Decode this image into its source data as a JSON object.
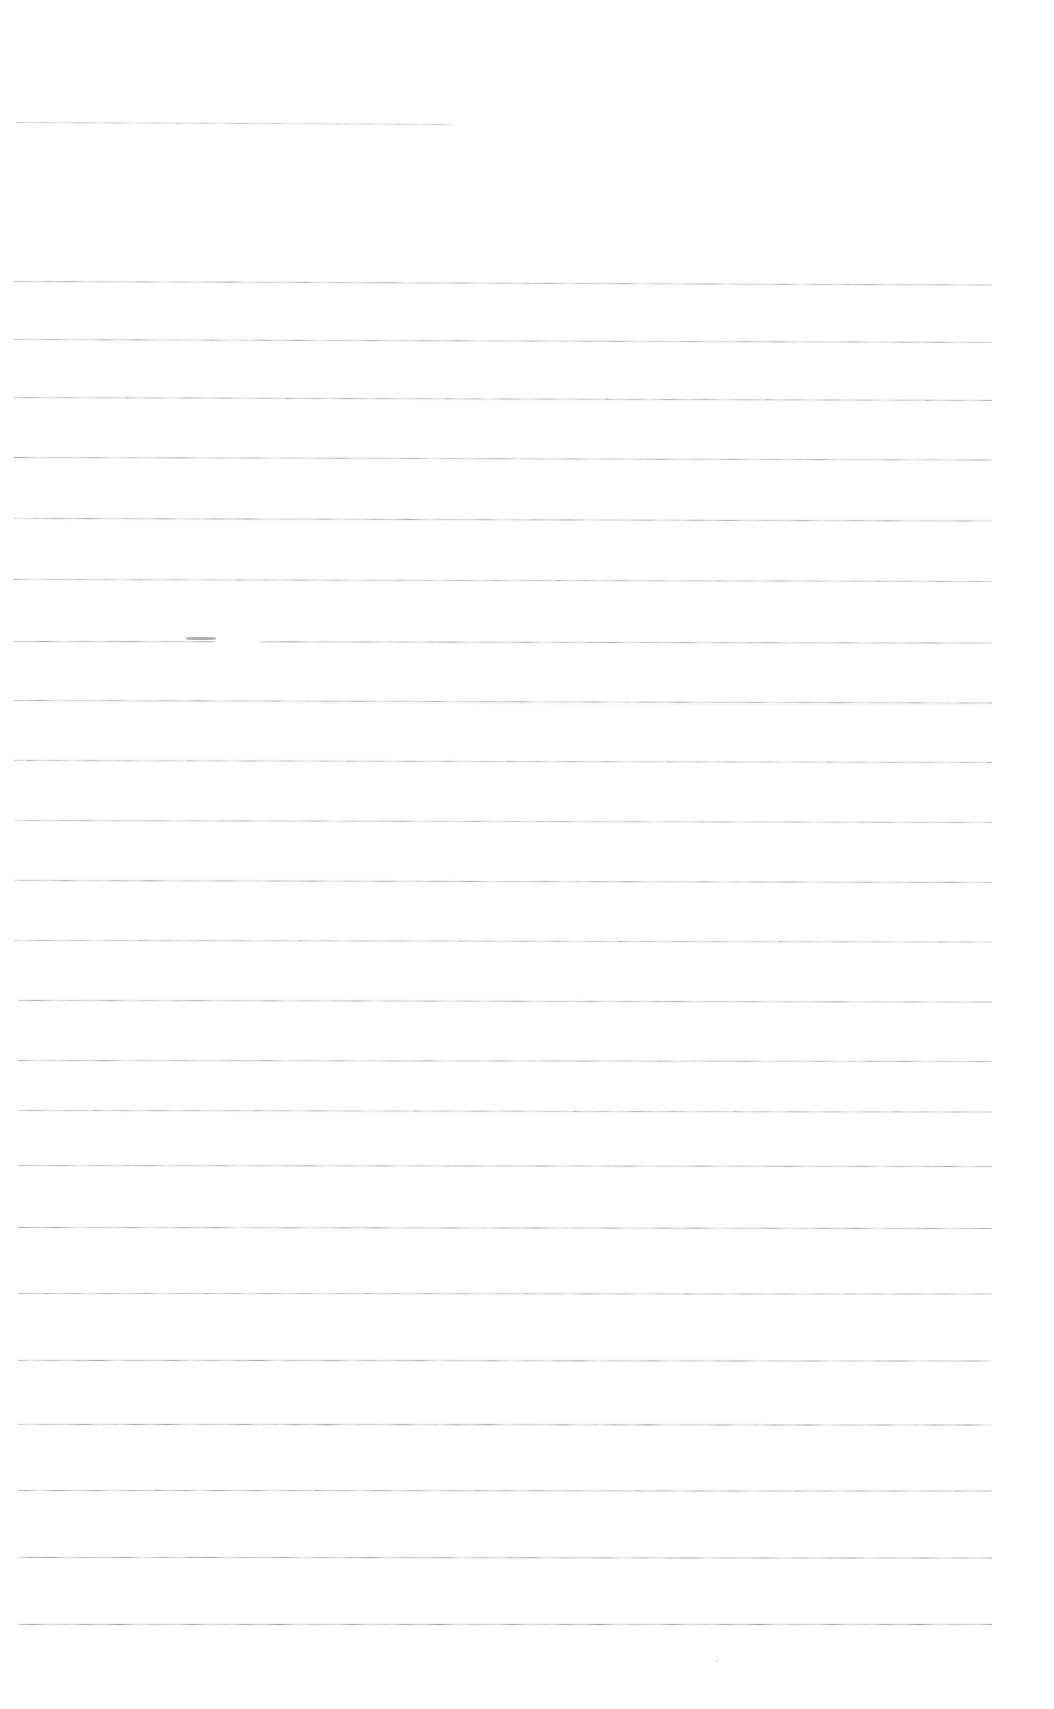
{
  "document": {
    "kind": "scanned-lined-paper",
    "title": "Blank ruled notebook page (scan)",
    "page_width": 1054,
    "page_height": 1709,
    "background_color": "#ffffff",
    "rule_color": "#8c8c90",
    "rule_color_light": "#b8b8bc",
    "text_content": "",
    "visible_text_count": 0,
    "rule_count": 24
  },
  "rules": [
    {
      "id": "rule-1",
      "y": 122,
      "x_start": 16,
      "x_end": 452,
      "slope": 2.0,
      "thickness": 1.0,
      "texture": "tex-a",
      "opacity": 0.55,
      "ghost": false
    },
    {
      "id": "rule-2",
      "y": 281,
      "x_start": 14,
      "x_end": 992,
      "slope": 3.5,
      "thickness": 1.0,
      "texture": "tex-b",
      "opacity": 0.72,
      "ghost": false
    },
    {
      "id": "rule-3",
      "y": 339,
      "x_start": 14,
      "x_end": 992,
      "slope": 3.0,
      "thickness": 1.0,
      "texture": "tex-c",
      "opacity": 0.7,
      "ghost": false
    },
    {
      "id": "rule-4",
      "y": 397,
      "x_start": 14,
      "x_end": 992,
      "slope": 3.0,
      "thickness": 1.0,
      "texture": "tex-a",
      "opacity": 0.74,
      "ghost": false
    },
    {
      "id": "rule-5",
      "y": 457,
      "x_start": 14,
      "x_end": 992,
      "slope": 2.5,
      "thickness": 1.0,
      "texture": "tex-b",
      "opacity": 0.7,
      "ghost": false
    },
    {
      "id": "rule-6",
      "y": 518,
      "x_start": 14,
      "x_end": 992,
      "slope": 2.5,
      "thickness": 1.0,
      "texture": "tex-c",
      "opacity": 0.72,
      "ghost": false
    },
    {
      "id": "rule-7",
      "y": 579,
      "x_start": 14,
      "x_end": 992,
      "slope": 2.0,
      "thickness": 1.0,
      "texture": "tex-a",
      "opacity": 0.7,
      "ghost": false
    },
    {
      "id": "rule-8",
      "y": 641,
      "x_start": 14,
      "x_end": 992,
      "slope": 1.5,
      "thickness": 1.0,
      "texture": "tex-b",
      "opacity": 0.76,
      "ghost": false,
      "broken": true
    },
    {
      "id": "rule-9",
      "y": 700,
      "x_start": 14,
      "x_end": 992,
      "slope": 2.5,
      "thickness": 1.0,
      "texture": "tex-c",
      "opacity": 0.7,
      "ghost": true
    },
    {
      "id": "rule-10",
      "y": 760,
      "x_start": 14,
      "x_end": 992,
      "slope": 2.0,
      "thickness": 1.0,
      "texture": "tex-a",
      "opacity": 0.68,
      "ghost": false
    },
    {
      "id": "rule-11",
      "y": 820,
      "x_start": 14,
      "x_end": 992,
      "slope": 2.0,
      "thickness": 1.0,
      "texture": "tex-b",
      "opacity": 0.66,
      "ghost": false
    },
    {
      "id": "rule-12",
      "y": 880,
      "x_start": 14,
      "x_end": 992,
      "slope": 2.0,
      "thickness": 1.0,
      "texture": "tex-c",
      "opacity": 0.72,
      "ghost": false
    },
    {
      "id": "rule-13",
      "y": 940,
      "x_start": 14,
      "x_end": 992,
      "slope": 1.5,
      "thickness": 1.0,
      "texture": "tex-a",
      "opacity": 0.68,
      "ghost": false
    },
    {
      "id": "rule-14",
      "y": 1000,
      "x_start": 18,
      "x_end": 992,
      "slope": 1.5,
      "thickness": 1.0,
      "texture": "tex-b",
      "opacity": 0.7,
      "ghost": false
    },
    {
      "id": "rule-15",
      "y": 1060,
      "x_start": 18,
      "x_end": 992,
      "slope": 1.0,
      "thickness": 1.0,
      "texture": "tex-c",
      "opacity": 0.68,
      "ghost": false
    },
    {
      "id": "rule-16",
      "y": 1110,
      "x_start": 18,
      "x_end": 992,
      "slope": 1.5,
      "thickness": 1.0,
      "texture": "tex-a",
      "opacity": 0.7,
      "ghost": false
    },
    {
      "id": "rule-17",
      "y": 1165,
      "x_start": 18,
      "x_end": 992,
      "slope": 1.0,
      "thickness": 1.1,
      "texture": "tex-b",
      "opacity": 0.74,
      "ghost": false
    },
    {
      "id": "rule-18",
      "y": 1227,
      "x_start": 18,
      "x_end": 992,
      "slope": 1.0,
      "thickness": 1.1,
      "texture": "tex-c",
      "opacity": 0.76,
      "ghost": false
    },
    {
      "id": "rule-19",
      "y": 1293,
      "x_start": 18,
      "x_end": 992,
      "slope": 0.5,
      "thickness": 1.1,
      "texture": "tex-a",
      "opacity": 0.74,
      "ghost": false
    },
    {
      "id": "rule-20",
      "y": 1360,
      "x_start": 18,
      "x_end": 992,
      "slope": 0.5,
      "thickness": 1.1,
      "texture": "tex-b",
      "opacity": 0.76,
      "ghost": false
    },
    {
      "id": "rule-21",
      "y": 1424,
      "x_start": 18,
      "x_end": 992,
      "slope": 0.5,
      "thickness": 1.2,
      "texture": "tex-c",
      "opacity": 0.8,
      "ghost": false
    },
    {
      "id": "rule-22",
      "y": 1490,
      "x_start": 18,
      "x_end": 992,
      "slope": 0.5,
      "thickness": 1.2,
      "texture": "tex-a",
      "opacity": 0.8,
      "ghost": false
    },
    {
      "id": "rule-23",
      "y": 1557,
      "x_start": 18,
      "x_end": 992,
      "slope": 0.5,
      "thickness": 1.2,
      "texture": "tex-b",
      "opacity": 0.82,
      "ghost": false
    },
    {
      "id": "rule-24",
      "y": 1624,
      "x_start": 18,
      "x_end": 992,
      "slope": 0.0,
      "thickness": 1.2,
      "texture": "tex-c",
      "opacity": 0.82,
      "ghost": false
    }
  ],
  "artifacts": {
    "break_gap": {
      "x": 215,
      "y": 636,
      "width": 44,
      "height": 8
    },
    "smudge": {
      "x": 186,
      "y": 637,
      "width": 30,
      "height": 2.6
    },
    "speck": {
      "x": 716,
      "y": 1660,
      "width": 2,
      "height": 2
    }
  }
}
